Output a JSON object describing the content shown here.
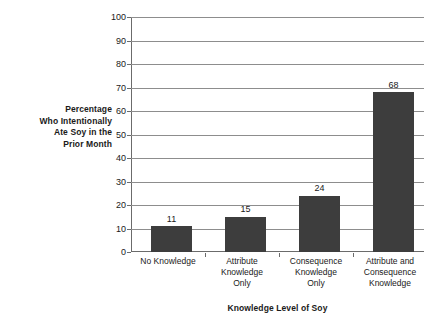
{
  "chart_data": {
    "type": "bar",
    "title": "",
    "xlabel": "Knowledge Level of Soy",
    "ylabel": "Percentage Who Intentionally Ate Soy in the Prior Month",
    "ylabel_lines": [
      "Percentage",
      "Who Intentionally",
      "Ate Soy in the",
      "Prior Month"
    ],
    "categories": [
      "No Knowledge",
      "Attribute Knowledge Only",
      "Consequence Knowledge Only",
      "Attribute and Consequence Knowledge"
    ],
    "category_label_lines": [
      [
        "No Knowledge"
      ],
      [
        "Attribute",
        "Knowledge",
        "Only"
      ],
      [
        "Consequence",
        "Knowledge",
        "Only"
      ],
      [
        "Attribute and",
        "Consequence",
        "Knowledge"
      ]
    ],
    "values": [
      11,
      15,
      24,
      68
    ],
    "value_labels": [
      "11",
      "15",
      "24",
      "68"
    ],
    "ylim": [
      0,
      100
    ],
    "ytick_step": 10,
    "ytick_labels": [
      "0",
      "10",
      "20",
      "30",
      "40",
      "50",
      "60",
      "70",
      "80",
      "90",
      "100"
    ],
    "grid": "horizontal",
    "legend": "none",
    "bar_color": "#3d3d3d",
    "gridline_color": "#8d8d8d",
    "axis_color": "#6b6b6b",
    "background_color": "#ffffff"
  }
}
